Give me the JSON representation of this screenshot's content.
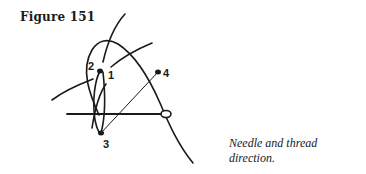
{
  "figure": {
    "title": "Figure 151",
    "caption": "Needle and thread direction."
  },
  "diagram": {
    "labels": [
      {
        "id": "1",
        "text": "1"
      },
      {
        "id": "2",
        "text": "2"
      },
      {
        "id": "3",
        "text": "3"
      },
      {
        "id": "4",
        "text": "4"
      }
    ]
  }
}
